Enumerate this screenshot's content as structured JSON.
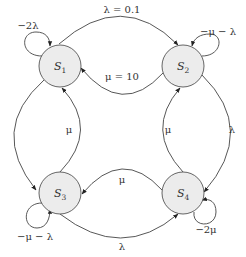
{
  "diagram": {
    "type": "markov-state-transition",
    "colors": {
      "node_fill": "#ececec",
      "node_stroke": "#555555",
      "edge": "#444444",
      "text": "#333333"
    },
    "states": [
      {
        "id": "S1",
        "base": "S",
        "sub": "1"
      },
      {
        "id": "S2",
        "base": "S",
        "sub": "2"
      },
      {
        "id": "S3",
        "base": "S",
        "sub": "3"
      },
      {
        "id": "S4",
        "base": "S",
        "sub": "4"
      }
    ],
    "transitions": [
      {
        "from": "S1",
        "to": "S2",
        "label": "λ = 0.1"
      },
      {
        "from": "S2",
        "to": "S1",
        "label": "μ = 10"
      },
      {
        "from": "S3",
        "to": "S1",
        "label": "μ"
      },
      {
        "from": "S4",
        "to": "S2",
        "label": "μ"
      },
      {
        "from": "S2",
        "to": "S4",
        "label": "λ"
      },
      {
        "from": "S4",
        "to": "S3",
        "label": "μ"
      },
      {
        "from": "S3",
        "to": "S4",
        "label": "λ"
      },
      {
        "from": "S1",
        "to": "S3",
        "label": ""
      }
    ],
    "self_loops": [
      {
        "state": "S1",
        "label": "−2λ"
      },
      {
        "state": "S2",
        "label": "−μ − λ"
      },
      {
        "state": "S3",
        "label": "−μ − λ"
      },
      {
        "state": "S4",
        "label": "−2μ"
      }
    ]
  }
}
